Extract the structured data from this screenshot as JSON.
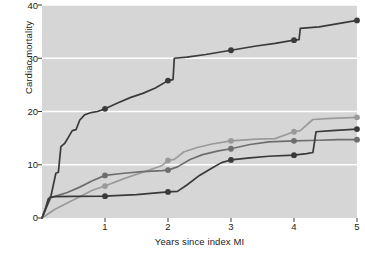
{
  "chart_data": {
    "type": "line",
    "title": "",
    "xlabel": "Years since index MI",
    "ylabel": "Cardiac mortality",
    "xlim": [
      0,
      5
    ],
    "ylim": [
      0,
      40
    ],
    "xticks": [
      "1",
      "2",
      "3",
      "4",
      "5"
    ],
    "xtick_values": [
      1,
      2,
      3,
      4,
      5
    ],
    "yticks": [
      "0",
      "10",
      "20",
      "30",
      "40"
    ],
    "ytick_values": [
      0,
      10,
      20,
      30,
      40
    ],
    "grid": "horizontal-white-gridlines",
    "plot_background": "#d6d6d6",
    "legend": "none",
    "marker": "filled-circle",
    "marker_x_values": [
      1,
      2,
      3,
      4,
      5
    ],
    "series": [
      {
        "name": "series-1-highest",
        "color": "#3a3a3a",
        "marker_values": [
          20.5,
          25.8,
          31.5,
          33.4,
          37.1
        ],
        "points": [
          [
            0.0,
            0.0
          ],
          [
            0.06,
            2.0
          ],
          [
            0.1,
            3.6
          ],
          [
            0.14,
            4.0
          ],
          [
            0.18,
            6.2
          ],
          [
            0.22,
            8.4
          ],
          [
            0.26,
            8.6
          ],
          [
            0.3,
            13.4
          ],
          [
            0.36,
            14.0
          ],
          [
            0.42,
            15.2
          ],
          [
            0.48,
            16.4
          ],
          [
            0.54,
            16.6
          ],
          [
            0.6,
            18.4
          ],
          [
            0.68,
            19.4
          ],
          [
            0.78,
            19.8
          ],
          [
            0.88,
            20.0
          ],
          [
            1.0,
            20.5
          ],
          [
            1.2,
            21.6
          ],
          [
            1.4,
            22.6
          ],
          [
            1.6,
            23.4
          ],
          [
            1.8,
            24.4
          ],
          [
            2.0,
            25.8
          ],
          [
            2.08,
            26.0
          ],
          [
            2.1,
            30.0
          ],
          [
            2.3,
            30.2
          ],
          [
            2.6,
            30.7
          ],
          [
            3.0,
            31.5
          ],
          [
            3.4,
            32.3
          ],
          [
            3.7,
            32.8
          ],
          [
            4.0,
            33.4
          ],
          [
            4.08,
            33.5
          ],
          [
            4.1,
            35.6
          ],
          [
            4.4,
            35.9
          ],
          [
            4.7,
            36.5
          ],
          [
            5.0,
            37.1
          ]
        ]
      },
      {
        "name": "series-2-light-gray",
        "color": "#9a9a9a",
        "marker_values": [
          6.0,
          10.8,
          14.5,
          16.2,
          18.9
        ],
        "points": [
          [
            0.0,
            0.0
          ],
          [
            0.2,
            1.6
          ],
          [
            0.4,
            2.8
          ],
          [
            0.6,
            4.0
          ],
          [
            0.8,
            5.2
          ],
          [
            1.0,
            6.0
          ],
          [
            1.3,
            7.4
          ],
          [
            1.6,
            8.6
          ],
          [
            1.9,
            9.8
          ],
          [
            2.0,
            10.8
          ],
          [
            2.1,
            11.0
          ],
          [
            2.25,
            12.4
          ],
          [
            2.45,
            13.2
          ],
          [
            2.7,
            13.9
          ],
          [
            3.0,
            14.5
          ],
          [
            3.4,
            14.8
          ],
          [
            3.7,
            14.9
          ],
          [
            4.0,
            16.2
          ],
          [
            4.1,
            16.4
          ],
          [
            4.3,
            18.5
          ],
          [
            4.6,
            18.7
          ],
          [
            5.0,
            18.9
          ]
        ]
      },
      {
        "name": "series-3-medium-gray",
        "color": "#6e6e6e",
        "marker_values": [
          8.0,
          9.0,
          13.0,
          14.5,
          14.7
        ],
        "points": [
          [
            0.0,
            0.0
          ],
          [
            0.08,
            2.2
          ],
          [
            0.14,
            3.8
          ],
          [
            0.22,
            4.1
          ],
          [
            0.4,
            4.8
          ],
          [
            0.6,
            5.8
          ],
          [
            0.8,
            7.0
          ],
          [
            1.0,
            8.0
          ],
          [
            1.3,
            8.4
          ],
          [
            1.6,
            8.7
          ],
          [
            1.9,
            8.9
          ],
          [
            2.0,
            9.0
          ],
          [
            2.15,
            9.6
          ],
          [
            2.35,
            11.0
          ],
          [
            2.55,
            11.9
          ],
          [
            2.8,
            12.6
          ],
          [
            3.0,
            13.0
          ],
          [
            3.3,
            13.8
          ],
          [
            3.6,
            14.3
          ],
          [
            4.0,
            14.5
          ],
          [
            4.4,
            14.6
          ],
          [
            4.7,
            14.7
          ],
          [
            5.0,
            14.7
          ]
        ]
      },
      {
        "name": "series-4-dark-low",
        "color": "#3a3a3a",
        "marker_values": [
          4.1,
          4.9,
          10.9,
          11.8,
          16.7
        ],
        "points": [
          [
            0.0,
            0.0
          ],
          [
            0.08,
            2.4
          ],
          [
            0.13,
            3.9
          ],
          [
            0.2,
            4.0
          ],
          [
            0.5,
            4.05
          ],
          [
            1.0,
            4.1
          ],
          [
            1.5,
            4.4
          ],
          [
            2.0,
            4.9
          ],
          [
            2.15,
            5.0
          ],
          [
            2.3,
            6.2
          ],
          [
            2.5,
            8.0
          ],
          [
            2.7,
            9.4
          ],
          [
            2.85,
            10.4
          ],
          [
            3.0,
            10.9
          ],
          [
            3.3,
            11.3
          ],
          [
            3.6,
            11.6
          ],
          [
            4.0,
            11.8
          ],
          [
            4.2,
            12.1
          ],
          [
            4.3,
            12.3
          ],
          [
            4.35,
            16.2
          ],
          [
            4.6,
            16.4
          ],
          [
            5.0,
            16.7
          ]
        ]
      }
    ]
  }
}
